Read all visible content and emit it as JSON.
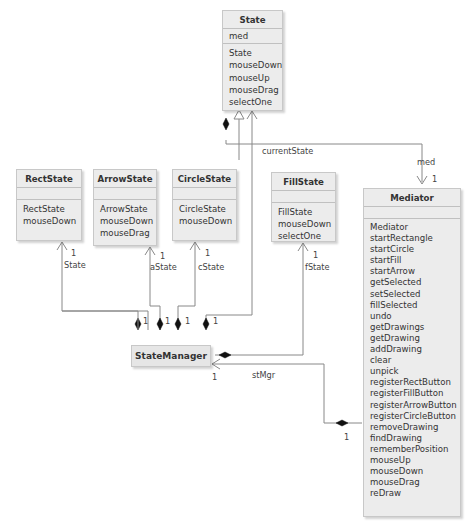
{
  "diagram": {
    "type": "UML class diagram",
    "classes": {
      "state": {
        "name": "State",
        "attributes": [
          "med"
        ],
        "operations": [
          "State",
          "mouseDown",
          "mouseUp",
          "mouseDrag",
          "selectOne"
        ]
      },
      "rectState": {
        "name": "RectState",
        "attributes": [],
        "operations": [
          "RectState",
          "mouseDown"
        ]
      },
      "arrowState": {
        "name": "ArrowState",
        "attributes": [],
        "operations": [
          "ArrowState",
          "mouseDown",
          "mouseDrag"
        ]
      },
      "circleState": {
        "name": "CircleState",
        "attributes": [],
        "operations": [
          "CircleState",
          "mouseDown"
        ]
      },
      "fillState": {
        "name": "FillState",
        "attributes": [],
        "operations": [
          "FillState",
          "mouseDown",
          "selectOne"
        ]
      },
      "mediator": {
        "name": "Mediator",
        "attributes": [],
        "operations": [
          "Mediator",
          "startRectangle",
          "startCircle",
          "startFill",
          "startArrow",
          "getSelected",
          "setSelected",
          "fillSelected",
          "undo",
          "getDrawings",
          "getDrawing",
          "addDrawing",
          "clear",
          "unpick",
          "registerRectButton",
          "registerFillButton",
          "registerArrowButton",
          "registerCircleButton",
          "removeDrawing",
          "findDrawing",
          "rememberPosition",
          "mouseUp",
          "mouseDown",
          "mouseDrag",
          "reDraw"
        ]
      },
      "stateManager": {
        "name": "StateManager"
      }
    },
    "roles": {
      "currentState": "currentState",
      "med": "med",
      "rState": "State",
      "aState": "aState",
      "cState": "cState",
      "fState": "fState",
      "stMgr": "stMgr"
    },
    "multiplicity": "1",
    "relationships": [
      {
        "from": "RectState",
        "to": "State",
        "kind": "generalization"
      },
      {
        "from": "ArrowState",
        "to": "State",
        "kind": "generalization"
      },
      {
        "from": "CircleState",
        "to": "State",
        "kind": "generalization"
      },
      {
        "from": "FillState",
        "to": "State",
        "kind": "generalization"
      },
      {
        "from": "State",
        "to": "Mediator",
        "kind": "composition",
        "role": "med",
        "multiplicity": "1"
      },
      {
        "from": "StateManager",
        "to": "State",
        "kind": "composition",
        "role": "currentState",
        "multiplicity": "1"
      },
      {
        "from": "StateManager",
        "to": "RectState",
        "kind": "composition",
        "role": "State",
        "multiplicity": "1"
      },
      {
        "from": "StateManager",
        "to": "ArrowState",
        "kind": "composition",
        "role": "aState",
        "multiplicity": "1"
      },
      {
        "from": "StateManager",
        "to": "CircleState",
        "kind": "composition",
        "role": "cState",
        "multiplicity": "1"
      },
      {
        "from": "StateManager",
        "to": "FillState",
        "kind": "composition",
        "role": "fState",
        "multiplicity": "1"
      },
      {
        "from": "Mediator",
        "to": "StateManager",
        "kind": "composition",
        "role": "stMgr",
        "multiplicity": "1"
      }
    ]
  }
}
